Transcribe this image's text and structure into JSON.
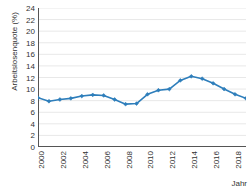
{
  "chart_data": {
    "type": "line",
    "title": "",
    "xlabel": "Jahr",
    "ylabel": "Arbeitslosenquote (%)",
    "xlim": [
      2000,
      2019
    ],
    "ylim": [
      0,
      24
    ],
    "ytick_step": 2,
    "xtick_step": 2,
    "grid": true,
    "legend": false,
    "line_color": "#2e7ebb",
    "marker": "diamond",
    "x": [
      2000,
      2001,
      2002,
      2003,
      2004,
      2005,
      2006,
      2007,
      2008,
      2009,
      2010,
      2011,
      2012,
      2013,
      2014,
      2015,
      2016,
      2017,
      2018,
      2019
    ],
    "values": [
      8.5,
      7.9,
      8.2,
      8.4,
      8.8,
      9.0,
      8.9,
      8.2,
      7.4,
      7.5,
      9.1,
      9.8,
      10.0,
      11.5,
      12.2,
      11.8,
      11.0,
      10.0,
      9.1,
      8.4
    ],
    "yticks": [
      0,
      2,
      4,
      6,
      8,
      10,
      12,
      14,
      16,
      18,
      20,
      22,
      24
    ],
    "xticks": [
      2000,
      2002,
      2004,
      2006,
      2008,
      2010,
      2012,
      2014,
      2016,
      2018
    ]
  }
}
